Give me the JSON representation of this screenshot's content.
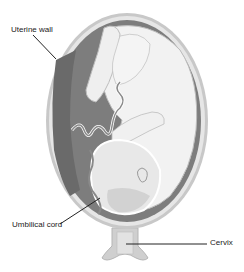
{
  "figure": {
    "labels": [
      {
        "id": "uterine_wall",
        "text": "Uterine wall"
      },
      {
        "id": "umbilical_cord",
        "text": "Umbilical cord"
      },
      {
        "id": "cervix",
        "text": "Cervix"
      }
    ],
    "colors": {
      "background": "#ffffff",
      "uterine_wall_outer": "#c8c8c8",
      "uterine_wall_inner": "#e6e6e6",
      "amniotic_cavity": "#7d7d7d",
      "fetus_skin": "#f2f2f2",
      "fetus_outline": "#bdbdbd",
      "placenta": "#cfcfcf",
      "cord": "#9a9a9a",
      "leader_line": "#222222",
      "label_text": "#222222"
    }
  }
}
